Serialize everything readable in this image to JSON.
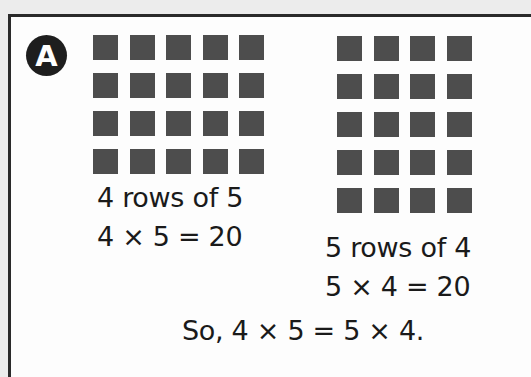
{
  "example": {
    "badge_label": "A",
    "left_array": {
      "rows": 4,
      "cols": 5,
      "caption": "4 rows of 5",
      "equation": "4 × 5 = 20"
    },
    "right_array": {
      "rows": 5,
      "cols": 4,
      "caption": "5 rows of 4",
      "equation": "5 × 4 = 20"
    },
    "conclusion": "So, 4 × 5 = 5 × 4.",
    "colors": {
      "square": "#4d4d4d",
      "border": "#2a2a2a",
      "badge": "#1e1e1e"
    }
  }
}
